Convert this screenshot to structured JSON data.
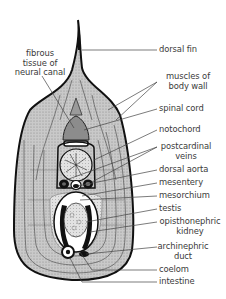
{
  "diagram": {
    "left_labels": [
      {
        "id": "fibrous-tissue",
        "lines": [
          "fibrous",
          "tissue of",
          "neural canal"
        ]
      }
    ],
    "right_labels": [
      {
        "id": "dorsal-fin",
        "lines": [
          "dorsal fin"
        ]
      },
      {
        "id": "muscles-of-body-wall",
        "lines": [
          "muscles of",
          "body wall"
        ]
      },
      {
        "id": "spinal-cord",
        "lines": [
          "spinal cord"
        ]
      },
      {
        "id": "notochord",
        "lines": [
          "notochord"
        ]
      },
      {
        "id": "postcardinal-veins",
        "lines": [
          "postcardinal",
          "veins"
        ]
      },
      {
        "id": "dorsal-aorta",
        "lines": [
          "dorsal aorta"
        ]
      },
      {
        "id": "mesentery",
        "lines": [
          "mesentery"
        ]
      },
      {
        "id": "mesorchium",
        "lines": [
          "mesorchium"
        ]
      },
      {
        "id": "testis",
        "lines": [
          "testis"
        ]
      },
      {
        "id": "opisthonephric-kidney",
        "lines": [
          "opisthonephric",
          "kidney"
        ]
      },
      {
        "id": "archinephric-duct",
        "lines": [
          "archinephric",
          "duct"
        ]
      },
      {
        "id": "coelom",
        "lines": [
          "coelom"
        ]
      },
      {
        "id": "intestine",
        "lines": [
          "intestine"
        ]
      }
    ],
    "colors": {
      "outline": "#111111",
      "muscle_fill": "#bdbdbd",
      "light_fill": "#e4e4e4",
      "leader_line": "#444444",
      "text": "#3a3a3a"
    }
  }
}
